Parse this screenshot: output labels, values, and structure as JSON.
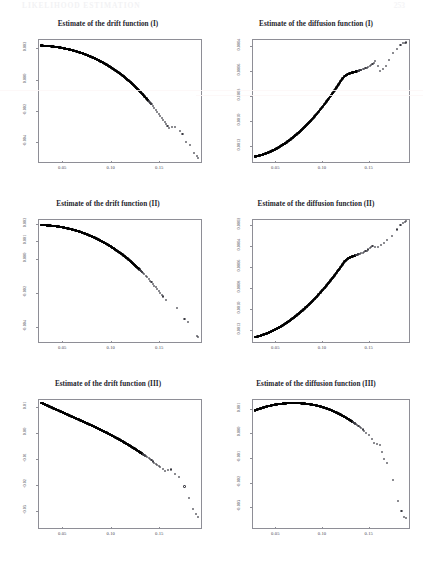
{
  "page": {
    "running_header": "LIKELIHOOD ESTIMATION",
    "page_number": "253"
  },
  "charts": [
    {
      "id": "drift-I",
      "title": "Estimate of the drift function (I)",
      "xticks": [
        "0.05",
        "0.10",
        "0.15"
      ],
      "yticks": [
        "0.002",
        "0.000",
        "-0.002",
        "-0.004"
      ]
    },
    {
      "id": "diffusion-I",
      "title": "Estimate of the diffusion function (I)",
      "xticks": [
        "0.05",
        "0.10",
        "0.15"
      ],
      "yticks": [
        "0.0012",
        "0.0010",
        "0.0008",
        "0.0006",
        "0.0004"
      ]
    },
    {
      "id": "drift-II",
      "title": "Estimate of the drift function (II)",
      "xticks": [
        "0.05",
        "0.10",
        "0.15"
      ],
      "yticks": [
        "0.002",
        "0.001",
        "0.000",
        "-0.002",
        "-0.004"
      ]
    },
    {
      "id": "diffusion-II",
      "title": "Estimate of the diffusion function (II)",
      "xticks": [
        "0.05",
        "0.10",
        "0.15"
      ],
      "yticks": [
        "0.0012",
        "0.0010",
        "0.0008",
        "0.0006",
        "0.0004",
        "0.0002"
      ]
    },
    {
      "id": "drift-III",
      "title": "Estimate of the drift function (III)",
      "xticks": [
        "0.05",
        "0.10",
        "0.15"
      ],
      "yticks": [
        "0.01",
        "0.00",
        "-0.01",
        "-0.02",
        "-0.03"
      ]
    },
    {
      "id": "diffusion-III",
      "title": "Estimate of the diffusion function (III)",
      "xticks": [
        "0.05",
        "0.10",
        "0.15"
      ],
      "yticks": [
        "0.001",
        "0.000",
        "-0.001",
        "-0.002",
        "-0.003"
      ]
    }
  ],
  "chart_data": [
    {
      "type": "scatter",
      "id": "drift-I",
      "title": "Estimate of the drift function (I)",
      "xlabel": "",
      "ylabel": "",
      "xlim": [
        0.025,
        0.192
      ],
      "ylim": [
        -0.0052,
        0.0026
      ],
      "xticks": [
        0.05,
        0.1,
        0.15
      ],
      "yticks": [
        0.002,
        0.0,
        -0.002,
        -0.004
      ],
      "grid": false,
      "legend": null,
      "marker": "open-circle",
      "description": "Dense band of overlapping circles forming a concave decreasing curve from upper-left, steepening sharply after x=0.15 into sparse scattered points.",
      "x": [
        0.028,
        0.031,
        0.034,
        0.037,
        0.04,
        0.043,
        0.046,
        0.049,
        0.052,
        0.055,
        0.058,
        0.061,
        0.064,
        0.067,
        0.07,
        0.073,
        0.076,
        0.079,
        0.082,
        0.085,
        0.088,
        0.091,
        0.094,
        0.097,
        0.1,
        0.103,
        0.106,
        0.109,
        0.112,
        0.115,
        0.118,
        0.121,
        0.124,
        0.127,
        0.13,
        0.133,
        0.136,
        0.139,
        0.142,
        0.145,
        0.148,
        0.151,
        0.154,
        0.157,
        0.16,
        0.166,
        0.171,
        0.174,
        0.178,
        0.182,
        0.186,
        0.189,
        0.19
      ],
      "y": [
        0.00218,
        0.00217,
        0.00216,
        0.00214,
        0.00212,
        0.0021,
        0.00207,
        0.00204,
        0.002,
        0.00196,
        0.00192,
        0.00187,
        0.00182,
        0.00176,
        0.0017,
        0.00163,
        0.00156,
        0.00148,
        0.0014,
        0.00131,
        0.00122,
        0.00112,
        0.00102,
        0.00091,
        0.00079,
        0.00067,
        0.00054,
        0.00041,
        0.00027,
        0.00012,
        -4e-05,
        -0.00021,
        -0.00038,
        -0.00056,
        -0.00075,
        -0.00095,
        -0.00115,
        -0.00136,
        -0.00158,
        -0.00181,
        -0.00205,
        -0.0023,
        -0.00256,
        -0.00283,
        -0.00311,
        -0.003,
        -0.0033,
        -0.00345,
        -0.004,
        -0.0042,
        -0.0047,
        -0.0049,
        -0.005
      ]
    },
    {
      "type": "scatter",
      "id": "diffusion-I",
      "title": "Estimate of the diffusion function (I)",
      "xlabel": "",
      "ylabel": "",
      "xlim": [
        0.025,
        0.192
      ],
      "ylim": [
        0.00028,
        0.00126
      ],
      "xticks": [
        0.05,
        0.1,
        0.15
      ],
      "yticks": [
        0.0004,
        0.0006,
        0.0008,
        0.001,
        0.0012
      ],
      "grid": false,
      "legend": null,
      "marker": "open-circle",
      "description": "Monotone increasing convex curve of dense overlapping circles, fanning into sparse points at the upper right.",
      "x": [
        0.028,
        0.031,
        0.034,
        0.037,
        0.04,
        0.043,
        0.046,
        0.049,
        0.052,
        0.055,
        0.058,
        0.061,
        0.064,
        0.067,
        0.07,
        0.073,
        0.076,
        0.079,
        0.082,
        0.085,
        0.088,
        0.091,
        0.094,
        0.097,
        0.1,
        0.103,
        0.106,
        0.109,
        0.112,
        0.115,
        0.118,
        0.121,
        0.124,
        0.127,
        0.13,
        0.133,
        0.136,
        0.139,
        0.142,
        0.145,
        0.148,
        0.151,
        0.154,
        0.157,
        0.162,
        0.168,
        0.172,
        0.176,
        0.18,
        0.184,
        0.187,
        0.189,
        0.19
      ],
      "y": [
        0.000315,
        0.00032,
        0.000326,
        0.000333,
        0.000341,
        0.00035,
        0.00036,
        0.000371,
        0.000383,
        0.000396,
        0.00041,
        0.000425,
        0.000441,
        0.000458,
        0.000476,
        0.000495,
        0.000515,
        0.000536,
        0.000558,
        0.000581,
        0.000605,
        0.00063,
        0.000656,
        0.000683,
        0.000711,
        0.00074,
        0.00077,
        0.000801,
        0.000833,
        0.000866,
        0.0009,
        0.000935,
        0.00096,
        0.000975,
        0.000985,
        0.000992,
        0.000998,
        0.001005,
        0.001012,
        0.00102,
        0.00103,
        0.001045,
        0.00106,
        0.00108,
        0.001,
        0.00104,
        0.00109,
        0.00115,
        0.00118,
        0.00121,
        0.001225,
        0.00123,
        0.001232
      ]
    },
    {
      "type": "scatter",
      "id": "drift-II",
      "title": "Estimate of the drift function (II)",
      "xlabel": "",
      "ylabel": "",
      "xlim": [
        0.025,
        0.192
      ],
      "ylim": [
        -0.0048,
        0.0023
      ],
      "xticks": [
        0.05,
        0.1,
        0.15
      ],
      "yticks": [
        0.002,
        0.001,
        0.0,
        -0.002,
        -0.004
      ],
      "grid": false,
      "legend": null,
      "marker": "open-circle",
      "description": "Concave decreasing curve similar to drift (I), dense at left, three isolated outlier points at lower right.",
      "x": [
        0.028,
        0.031,
        0.034,
        0.037,
        0.04,
        0.043,
        0.046,
        0.049,
        0.052,
        0.055,
        0.058,
        0.061,
        0.064,
        0.067,
        0.07,
        0.073,
        0.076,
        0.079,
        0.082,
        0.085,
        0.088,
        0.091,
        0.094,
        0.097,
        0.1,
        0.103,
        0.106,
        0.109,
        0.112,
        0.115,
        0.118,
        0.121,
        0.124,
        0.127,
        0.13,
        0.133,
        0.136,
        0.139,
        0.142,
        0.145,
        0.148,
        0.151,
        0.154,
        0.157,
        0.168,
        0.176,
        0.18,
        0.189,
        0.19
      ],
      "y": [
        0.00195,
        0.00194,
        0.00193,
        0.00192,
        0.0019,
        0.00188,
        0.00186,
        0.00183,
        0.0018,
        0.00176,
        0.00172,
        0.00168,
        0.00163,
        0.00158,
        0.00152,
        0.00146,
        0.00139,
        0.00132,
        0.00125,
        0.00117,
        0.00108,
        0.00099,
        0.0009,
        0.0008,
        0.0007,
        0.00059,
        0.00047,
        0.00035,
        0.00023,
        0.0001,
        -4e-05,
        -0.00019,
        -0.00034,
        -0.0005,
        -0.00066,
        -0.00083,
        -0.00101,
        -0.00119,
        -0.00138,
        -0.00158,
        -0.00178,
        -0.00199,
        -0.00221,
        -0.00244,
        -0.0029,
        -0.0035,
        -0.0037,
        -0.0045,
        -0.00455
      ]
    },
    {
      "type": "scatter",
      "id": "diffusion-II",
      "title": "Estimate of the diffusion function (II)",
      "xlabel": "",
      "ylabel": "",
      "xlim": [
        0.025,
        0.192
      ],
      "ylim": [
        0.0001,
        0.00126
      ],
      "xticks": [
        0.05,
        0.1,
        0.15
      ],
      "yticks": [
        0.0002,
        0.0004,
        0.0006,
        0.0008,
        0.001,
        0.0012
      ],
      "grid": false,
      "legend": null,
      "marker": "open-circle",
      "description": "Increasing convex curve from low left to high right, dense overlapping band becoming sparse scattered circles near the top.",
      "x": [
        0.028,
        0.031,
        0.034,
        0.037,
        0.04,
        0.043,
        0.046,
        0.049,
        0.052,
        0.055,
        0.058,
        0.061,
        0.064,
        0.067,
        0.07,
        0.073,
        0.076,
        0.079,
        0.082,
        0.085,
        0.088,
        0.091,
        0.094,
        0.097,
        0.1,
        0.103,
        0.106,
        0.109,
        0.112,
        0.115,
        0.118,
        0.121,
        0.124,
        0.127,
        0.13,
        0.133,
        0.136,
        0.139,
        0.142,
        0.145,
        0.148,
        0.151,
        0.154,
        0.16,
        0.166,
        0.17,
        0.175,
        0.18,
        0.184,
        0.187,
        0.189,
        0.19
      ],
      "y": [
        0.000135,
        0.000142,
        0.00015,
        0.000159,
        0.000169,
        0.00018,
        0.000192,
        0.000205,
        0.000219,
        0.000234,
        0.00025,
        0.000267,
        0.000285,
        0.000304,
        0.000324,
        0.000345,
        0.000367,
        0.00039,
        0.000414,
        0.000439,
        0.000465,
        0.000492,
        0.00052,
        0.000549,
        0.000579,
        0.00061,
        0.000642,
        0.000675,
        0.000709,
        0.000744,
        0.00078,
        0.000817,
        0.000855,
        0.00088,
        0.000895,
        0.000905,
        0.000915,
        0.000925,
        0.000935,
        0.000945,
        0.00096,
        0.00098,
        0.001005,
        0.00099,
        0.00103,
        0.00106,
        0.0011,
        0.00116,
        0.0012,
        0.001225,
        0.001235,
        0.00124
      ]
    },
    {
      "type": "scatter",
      "id": "drift-III",
      "title": "Estimate of the drift function (III)",
      "xlabel": "",
      "ylabel": "",
      "xlim": [
        0.025,
        0.192
      ],
      "ylim": [
        -0.036,
        0.013
      ],
      "xticks": [
        0.05,
        0.1,
        0.15
      ],
      "yticks": [
        0.01,
        0.0,
        -0.01,
        -0.02,
        -0.03
      ],
      "grid": false,
      "legend": null,
      "marker": "open-circle",
      "description": "Nearly straight decreasing line of densely overlapping circles, spreading into sparse points at the lower right.",
      "x": [
        0.028,
        0.031,
        0.034,
        0.037,
        0.04,
        0.043,
        0.046,
        0.049,
        0.052,
        0.055,
        0.058,
        0.061,
        0.064,
        0.067,
        0.07,
        0.073,
        0.076,
        0.079,
        0.082,
        0.085,
        0.088,
        0.091,
        0.094,
        0.097,
        0.1,
        0.103,
        0.106,
        0.109,
        0.112,
        0.115,
        0.118,
        0.121,
        0.124,
        0.127,
        0.13,
        0.133,
        0.136,
        0.139,
        0.142,
        0.145,
        0.148,
        0.151,
        0.156,
        0.162,
        0.166,
        0.17,
        0.176,
        0.181,
        0.185,
        0.188,
        0.19
      ],
      "y": [
        0.0116,
        0.0111,
        0.0106,
        0.0101,
        0.0096,
        0.0091,
        0.0086,
        0.0081,
        0.0076,
        0.0071,
        0.0066,
        0.0061,
        0.0056,
        0.0051,
        0.0046,
        0.0041,
        0.0036,
        0.0031,
        0.0026,
        0.00205,
        0.0015,
        0.00095,
        0.0004,
        -0.00015,
        -0.00075,
        -0.00135,
        -0.00195,
        -0.00255,
        -0.0032,
        -0.00385,
        -0.0045,
        -0.0052,
        -0.0059,
        -0.0066,
        -0.00735,
        -0.0081,
        -0.0089,
        -0.0097,
        -0.0105,
        -0.01135,
        -0.0122,
        -0.0131,
        -0.0145,
        -0.014,
        -0.0156,
        -0.017,
        -0.0205,
        -0.025,
        -0.029,
        -0.031,
        -0.032
      ]
    },
    {
      "type": "scatter",
      "id": "diffusion-III",
      "title": "Estimate of the diffusion function (III)",
      "xlabel": "",
      "ylabel": "",
      "xlim": [
        0.025,
        0.192
      ],
      "ylim": [
        -0.0038,
        0.0014
      ],
      "xticks": [
        0.05,
        0.1,
        0.15
      ],
      "yticks": [
        0.001,
        0.0,
        -0.001,
        -0.002,
        -0.003
      ],
      "grid": false,
      "legend": null,
      "marker": "open-circle",
      "description": "Concave curve rising to a maximum near x=0.085 then falling steeply; sparse scattered circles below right.",
      "x": [
        0.028,
        0.031,
        0.034,
        0.037,
        0.04,
        0.043,
        0.046,
        0.049,
        0.052,
        0.055,
        0.058,
        0.061,
        0.064,
        0.067,
        0.07,
        0.073,
        0.076,
        0.079,
        0.082,
        0.085,
        0.088,
        0.091,
        0.094,
        0.097,
        0.1,
        0.103,
        0.106,
        0.109,
        0.112,
        0.115,
        0.118,
        0.121,
        0.124,
        0.127,
        0.13,
        0.133,
        0.136,
        0.139,
        0.142,
        0.145,
        0.15,
        0.156,
        0.162,
        0.166,
        0.17,
        0.176,
        0.181,
        0.185,
        0.188,
        0.19
      ],
      "y": [
        0.00093,
        0.000975,
        0.001015,
        0.00105,
        0.001085,
        0.001115,
        0.00114,
        0.001165,
        0.001185,
        0.0012,
        0.001212,
        0.001222,
        0.001228,
        0.001232,
        0.001233,
        0.001232,
        0.001228,
        0.00122,
        0.00121,
        0.001197,
        0.00118,
        0.00116,
        0.001136,
        0.001108,
        0.001076,
        0.00104,
        0.001,
        0.000956,
        0.000908,
        0.000856,
        0.0008,
        0.00074,
        0.000676,
        0.000608,
        0.000536,
        0.00046,
        0.00038,
        0.000296,
        0.000208,
        0.000116,
        -5e-05,
        -0.0004,
        -0.00048,
        -0.00105,
        -0.0012,
        -0.0019,
        -0.00275,
        -0.00315,
        -0.0034,
        -0.00345
      ]
    }
  ]
}
